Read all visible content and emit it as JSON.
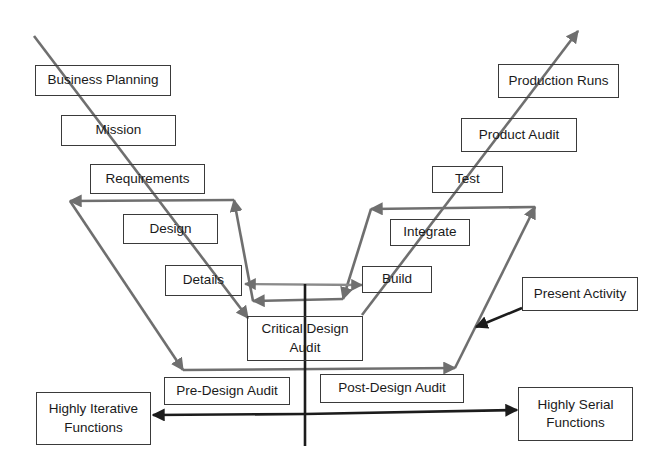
{
  "diagram": {
    "type": "vee-process-diagram",
    "colors": {
      "process_arrow": "#6f6f6f",
      "axis_arrow": "#1c1c1c",
      "box_border": "#3a3a3a",
      "text": "#1a1a1a"
    },
    "left_branch": {
      "boxes": [
        {
          "id": "business-planning",
          "label": "Business Planning"
        },
        {
          "id": "mission",
          "label": "Mission"
        },
        {
          "id": "requirements",
          "label": "Requirements"
        },
        {
          "id": "design",
          "label": "Design"
        },
        {
          "id": "details",
          "label": "Details"
        }
      ]
    },
    "center": {
      "critical_design_audit": "Critical Design Audit",
      "critical_design_audit_line1": "Critical Design",
      "critical_design_audit_line2": "Audit"
    },
    "right_branch": {
      "boxes": [
        {
          "id": "build",
          "label": "Build"
        },
        {
          "id": "integrate",
          "label": "Integrate"
        },
        {
          "id": "test",
          "label": "Test"
        },
        {
          "id": "product-audit",
          "label": "Product Audit"
        },
        {
          "id": "production-runs",
          "label": "Production Runs"
        }
      ]
    },
    "bottom": {
      "pre_design_audit": "Pre-Design Audit",
      "post_design_audit": "Post-Design Audit"
    },
    "axis": {
      "left_label_line1": "Highly Iterative",
      "left_label_line2": "Functions",
      "right_label_line1": "Highly Serial",
      "right_label_line2": "Functions"
    },
    "callout": {
      "label": "Present Activity"
    }
  }
}
